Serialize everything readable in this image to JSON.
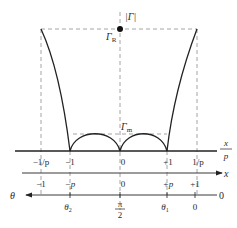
{
  "diagram": {
    "colors": {
      "curve": "#222222",
      "axis": "#222222",
      "dashed": "#9a9a9a",
      "text": "#2a2a2a"
    },
    "labels": {
      "y_axis": "|Γ|",
      "gamma_R": "Γ",
      "gamma_R_sub": "R",
      "gamma_m": "Γ",
      "gamma_m_sub": "m",
      "axis1_num": "x",
      "axis1_den": "p",
      "axis2": "x",
      "axis3": "θ",
      "axis3_right": "0"
    },
    "axis1_ticks": [
      "−1/p",
      "−1",
      "0",
      "+1",
      "1/p"
    ],
    "axis2_ticks": [
      "−1",
      "−p",
      "0",
      "+p",
      "+1"
    ],
    "axis3_ticks": {
      "theta2": "θ",
      "theta2_sub": "2",
      "pi_num": "π",
      "pi_den": "2",
      "theta1": "θ",
      "theta1_sub": "1",
      "zero": "0"
    }
  }
}
